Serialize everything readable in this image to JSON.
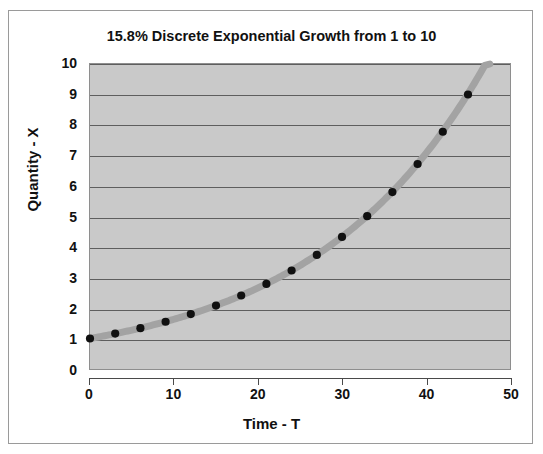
{
  "chart_data": {
    "type": "line",
    "title": "15.8% Discrete Exponential Growth from 1 to 10",
    "xlabel": "Time - T",
    "ylabel": "Quantity - X",
    "xlim": [
      0,
      50
    ],
    "ylim": [
      0,
      10
    ],
    "xticks": [
      0,
      10,
      20,
      30,
      40,
      50
    ],
    "yticks": [
      0,
      1,
      2,
      3,
      4,
      5,
      6,
      7,
      8,
      9,
      10
    ],
    "grid": "horizontal",
    "legend": "none",
    "markers": "filled-circle",
    "series": [
      {
        "name": "Quantity - X",
        "line_color": "#a3a3a3",
        "marker_color": "#101010",
        "x": [
          0,
          3,
          6,
          9,
          12,
          15,
          18,
          21,
          24,
          27,
          30,
          33,
          36,
          39,
          42,
          45
        ],
        "y": [
          1.0,
          1.16,
          1.34,
          1.55,
          1.8,
          2.08,
          2.41,
          2.79,
          3.23,
          3.74,
          4.33,
          5.01,
          5.8,
          6.72,
          7.78,
          9.0
        ]
      }
    ],
    "curve": {
      "description": "continuous exponential trace through markers, extending to X=10",
      "x_end": 47.6,
      "y_end": 10.0,
      "color": "#a3a3a3"
    },
    "growth_rate_percent": 15.8,
    "start_value": 1,
    "end_value": 10
  },
  "plot": {
    "background_color": "#c9c9c9",
    "gridline_color": "#5e5e5e",
    "border_color": "#8e8e8e"
  },
  "frame": {
    "border_color": "#9a9a9a",
    "background_color": "#ffffff"
  }
}
